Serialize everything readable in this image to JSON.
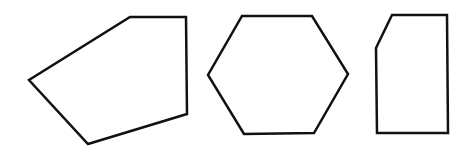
{
  "canvas": {
    "width": 468,
    "height": 151,
    "background": "#ffffff"
  },
  "style": {
    "stroke": "#111111",
    "stroke_width": 2.5,
    "fill": "#ffffff"
  },
  "shapes": [
    {
      "name": "irregular-pentagon",
      "sides": 5,
      "points": "130,17 186,17 187,114 88,144 29,80"
    },
    {
      "name": "regular-hexagon",
      "sides": 6,
      "points": "242,16 312,16 348,74 314,133 244,134 208,75"
    },
    {
      "name": "clipped-rectangle-pentagon",
      "sides": 5,
      "points": "392,15 447,15 448,133 377,133 376,48"
    }
  ]
}
